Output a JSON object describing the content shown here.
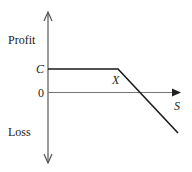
{
  "diagram": {
    "type": "payoff-diagram",
    "y_axis": {
      "top_label": "Profit",
      "bottom_label": "Loss"
    },
    "x_axis": {
      "label": "S"
    },
    "ticks": {
      "c_label": "C",
      "zero_label": "0"
    },
    "kink_label": "X",
    "colors": {
      "axis": "#555555",
      "payoff_line": "#1a1a1a",
      "text": "#222222"
    },
    "payoff_curve": [
      {
        "s": "0",
        "profit": "C"
      },
      {
        "s": "X",
        "profit": "C"
      },
      {
        "s": "> X",
        "profit": "decreasing, crosses 0 beyond X"
      }
    ]
  }
}
